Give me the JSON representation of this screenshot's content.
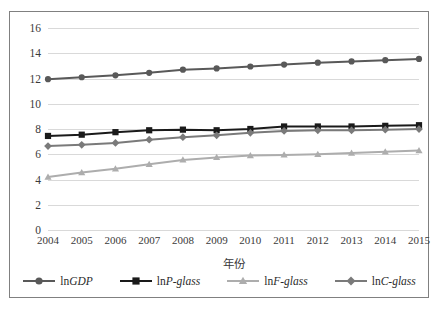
{
  "chart_data": {
    "type": "line",
    "title": "",
    "xlabel": "年份",
    "ylabel": "",
    "categories": [
      "2004",
      "2005",
      "2006",
      "2007",
      "2008",
      "2009",
      "2010",
      "2011",
      "2012",
      "2013",
      "2014",
      "2015"
    ],
    "ylim": [
      0,
      16
    ],
    "ytick_values": [
      0,
      2,
      4,
      6,
      8,
      10,
      12,
      14,
      16
    ],
    "ytick_labels": [
      "0",
      "2",
      "4",
      "6",
      "8",
      "10",
      "12",
      "14",
      "16"
    ],
    "grid": true,
    "legend_position": "bottom",
    "series": [
      {
        "name": "lnGDP",
        "name_prefix": "ln",
        "name_italic": "GDP",
        "marker": "circle",
        "color": "#595959",
        "values": [
          11.95,
          12.1,
          12.25,
          12.45,
          12.7,
          12.8,
          12.95,
          13.1,
          13.25,
          13.35,
          13.45,
          13.55
        ]
      },
      {
        "name": "lnP-glass",
        "name_prefix": "ln",
        "name_italic": "P-glass",
        "marker": "square",
        "color": "#1a1a1a",
        "values": [
          7.45,
          7.55,
          7.75,
          7.9,
          7.95,
          7.9,
          8.0,
          8.2,
          8.2,
          8.2,
          8.25,
          8.3
        ]
      },
      {
        "name": "lnF-glass",
        "name_prefix": "ln",
        "name_italic": "F-glass",
        "marker": "triangle",
        "color": "#adadad",
        "values": [
          4.2,
          4.55,
          4.85,
          5.2,
          5.55,
          5.75,
          5.9,
          5.95,
          6.0,
          6.1,
          6.2,
          6.3
        ]
      },
      {
        "name": "lnC-glass",
        "name_prefix": "ln",
        "name_italic": "C-glass",
        "marker": "diamond",
        "color": "#7a7a7a",
        "values": [
          6.65,
          6.75,
          6.9,
          7.15,
          7.35,
          7.5,
          7.7,
          7.85,
          7.9,
          7.9,
          7.95,
          8.0
        ]
      }
    ]
  }
}
